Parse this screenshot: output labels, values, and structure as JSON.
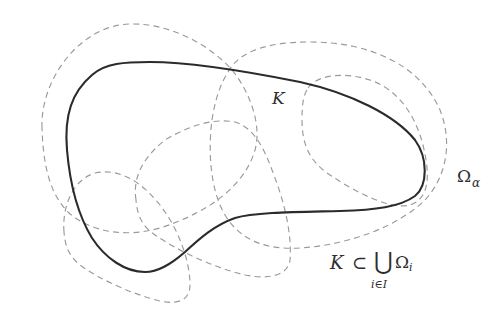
{
  "figure": {
    "labels": {
      "set": "K",
      "cover_element_symbol": "Ω",
      "cover_element_subscript": "α",
      "formula": {
        "lhs": "K",
        "relation": "⊂",
        "operator": "⋃",
        "operator_index": "i∈I",
        "term_symbol": "Ω",
        "term_subscript": "i"
      }
    },
    "colors": {
      "set_K_stroke": "#2b2b2b",
      "cover_stroke": "#9a9a9a",
      "background": "#ffffff"
    },
    "shapes": {
      "set_K": "solid closed curve",
      "cover_sets_count": 5,
      "cover_style": "dashed closed curves"
    }
  }
}
